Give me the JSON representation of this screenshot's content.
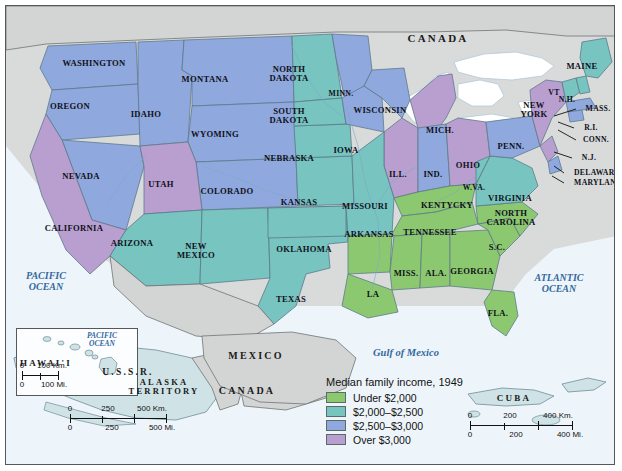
{
  "title": "Median family income, 1949",
  "legend": {
    "title": "Median family income, 1949",
    "items": [
      {
        "label": "Under $2,000",
        "color": "#8cc870"
      },
      {
        "label": "$2,000–$2,500",
        "color": "#77c4c0"
      },
      {
        "label": "$2,500–$3,000",
        "color": "#8fa8dd"
      },
      {
        "label": "Over $3,000",
        "color": "#b89fcf"
      }
    ]
  },
  "chart_data": {
    "type": "map",
    "title": "Median family income, 1949",
    "categories": [
      "Under $2,000",
      "$2,000–$2,500",
      "$2,500–$3,000",
      "Over $3,000"
    ],
    "colors": [
      "#8cc870",
      "#77c4c0",
      "#8fa8dd",
      "#b89fcf"
    ],
    "regions": [
      {
        "name": "WASHINGTON",
        "category": "$2,500–$3,000"
      },
      {
        "name": "OREGON",
        "category": "$2,500–$3,000"
      },
      {
        "name": "IDAHO",
        "category": "$2,500–$3,000"
      },
      {
        "name": "MONTANA",
        "category": "$2,500–$3,000"
      },
      {
        "name": "NEVADA",
        "category": "$2,500–$3,000"
      },
      {
        "name": "WYOMING",
        "category": "$2,500–$3,000"
      },
      {
        "name": "CALIFORNIA",
        "category": "Over $3,000"
      },
      {
        "name": "UTAH",
        "category": "Over $3,000"
      },
      {
        "name": "COLORADO",
        "category": "$2,500–$3,000"
      },
      {
        "name": "ARIZONA",
        "category": "$2,000–$2,500"
      },
      {
        "name": "NEW MEXICO",
        "category": "$2,000–$2,500"
      },
      {
        "name": "TEXAS",
        "category": "$2,000–$2,500"
      },
      {
        "name": "OKLAHOMA",
        "category": "$2,000–$2,500"
      },
      {
        "name": "KANSAS",
        "category": "$2,000–$2,500"
      },
      {
        "name": "NEBRASKA",
        "category": "$2,000–$2,500"
      },
      {
        "name": "NORTH DAKOTA",
        "category": "$2,000–$2,500"
      },
      {
        "name": "SOUTH DAKOTA",
        "category": "$2,000–$2,500"
      },
      {
        "name": "MINN.",
        "category": "$2,500–$3,000"
      },
      {
        "name": "IOWA",
        "category": "$2,500–$3,000"
      },
      {
        "name": "WISCONSIN",
        "category": "$2,500–$3,000"
      },
      {
        "name": "MICH.",
        "category": "Over $3,000"
      },
      {
        "name": "ILL.",
        "category": "Over $3,000"
      },
      {
        "name": "IND.",
        "category": "$2,500–$3,000"
      },
      {
        "name": "OHIO",
        "category": "Over $3,000"
      },
      {
        "name": "MISSOURI",
        "category": "$2,000–$2,500"
      },
      {
        "name": "ARKANSAS",
        "category": "Under $2,000"
      },
      {
        "name": "KENTYCKY",
        "category": "Under $2,000"
      },
      {
        "name": "TENNESSEE",
        "category": "Under $2,000"
      },
      {
        "name": "MISS.",
        "category": "Under $2,000"
      },
      {
        "name": "ALA.",
        "category": "Under $2,000"
      },
      {
        "name": "GEORGIA",
        "category": "Under $2,000"
      },
      {
        "name": "LA",
        "category": "Under $2,000"
      },
      {
        "name": "FLA.",
        "category": "Under $2,000"
      },
      {
        "name": "S.C.",
        "category": "Under $2,000"
      },
      {
        "name": "NORTH CAROLINA",
        "category": "Under $2,000"
      },
      {
        "name": "VIRGINIA",
        "category": "$2,000–$2,500"
      },
      {
        "name": "W.VA.",
        "category": "$2,000–$2,500"
      },
      {
        "name": "MARYLAND",
        "category": "$2,500–$3,000"
      },
      {
        "name": "DELAWARE",
        "category": "$2,500–$3,000"
      },
      {
        "name": "PENN.",
        "category": "$2,500–$3,000"
      },
      {
        "name": "NEW YORK",
        "category": "Over $3,000"
      },
      {
        "name": "N.J.",
        "category": "Over $3,000"
      },
      {
        "name": "CONN.",
        "category": "Over $3,000"
      },
      {
        "name": "R.I.",
        "category": "$2,500–$3,000"
      },
      {
        "name": "MASS.",
        "category": "$2,500–$3,000"
      },
      {
        "name": "VT",
        "category": "$2,000–$2,500"
      },
      {
        "name": "N.H.",
        "category": "$2,000–$2,500"
      },
      {
        "name": "MAINE",
        "category": "$2,000–$2,500"
      },
      {
        "name": "ALASKA TERRITORY",
        "category": "$2,000–$2,500"
      },
      {
        "name": "HAWAI'I",
        "category": "$2,000–$2,500"
      }
    ]
  },
  "states": [
    {
      "id": "washington",
      "label": "WASHINGTON",
      "x": 88,
      "y": 57,
      "size": "s9"
    },
    {
      "id": "oregon",
      "label": "OREGON",
      "x": 64,
      "y": 100,
      "size": "s9"
    },
    {
      "id": "idaho",
      "label": "IDAHO",
      "x": 140,
      "y": 108,
      "size": "s9"
    },
    {
      "id": "montana",
      "label": "MONTANA",
      "x": 199,
      "y": 73,
      "size": "s9"
    },
    {
      "id": "nevada",
      "label": "NEVADA",
      "x": 75,
      "y": 170,
      "size": "s9"
    },
    {
      "id": "wyoming",
      "label": "WYOMING",
      "x": 209,
      "y": 128,
      "size": "s9"
    },
    {
      "id": "california",
      "label": "CALIFORNIA",
      "x": 68,
      "y": 222,
      "size": "s9"
    },
    {
      "id": "utah",
      "label": "UTAH",
      "x": 155,
      "y": 178,
      "size": "s9"
    },
    {
      "id": "colorado",
      "label": "COLORADO",
      "x": 221,
      "y": 185,
      "size": "s9"
    },
    {
      "id": "arizona",
      "label": "ARIZONA",
      "x": 126,
      "y": 237,
      "size": "s9"
    },
    {
      "id": "new-mexico",
      "label": "NEW\nMEXICO",
      "x": 190,
      "y": 245,
      "size": "s9"
    },
    {
      "id": "texas",
      "label": "TEXAS",
      "x": 285,
      "y": 293,
      "size": "s9"
    },
    {
      "id": "oklahoma",
      "label": "OKLAHOMA",
      "x": 298,
      "y": 243,
      "size": "s9"
    },
    {
      "id": "kansas",
      "label": "KANSAS",
      "x": 293,
      "y": 196,
      "size": "s9"
    },
    {
      "id": "nebraska",
      "label": "NEBRASKA",
      "x": 283,
      "y": 152,
      "size": "s9"
    },
    {
      "id": "north-dakota",
      "label": "NORTH\nDAKOTA",
      "x": 283,
      "y": 68,
      "size": "s9"
    },
    {
      "id": "south-dakota",
      "label": "SOUTH\nDAKOTA",
      "x": 283,
      "y": 110,
      "size": "s9"
    },
    {
      "id": "minnesota",
      "label": "MINN.",
      "x": 335,
      "y": 88,
      "size": "s8"
    },
    {
      "id": "iowa",
      "label": "IOWA",
      "x": 340,
      "y": 144,
      "size": "s9"
    },
    {
      "id": "wisconsin",
      "label": "WISCONSIN",
      "x": 374,
      "y": 104,
      "size": "s9"
    },
    {
      "id": "michigan",
      "label": "MICH.",
      "x": 434,
      "y": 124,
      "size": "s9"
    },
    {
      "id": "illinois",
      "label": "ILL.",
      "x": 392,
      "y": 168,
      "size": "s9"
    },
    {
      "id": "indiana",
      "label": "IND.",
      "x": 427,
      "y": 168,
      "size": "s9"
    },
    {
      "id": "ohio",
      "label": "OHIO",
      "x": 462,
      "y": 159,
      "size": "s9"
    },
    {
      "id": "missouri",
      "label": "MISSOURI",
      "x": 359,
      "y": 200,
      "size": "s9"
    },
    {
      "id": "arkansas",
      "label": "ARKANSAS",
      "x": 363,
      "y": 228,
      "size": "s9"
    },
    {
      "id": "kentucky",
      "label": "KENTYCKY",
      "x": 441,
      "y": 199,
      "size": "s9"
    },
    {
      "id": "tennessee",
      "label": "TENNESSEE",
      "x": 424,
      "y": 226,
      "size": "s9"
    },
    {
      "id": "mississippi",
      "label": "MISS.",
      "x": 400,
      "y": 267,
      "size": "s9"
    },
    {
      "id": "alabama",
      "label": "ALA.",
      "x": 430,
      "y": 267,
      "size": "s9"
    },
    {
      "id": "georgia",
      "label": "GEORGIA",
      "x": 466,
      "y": 265,
      "size": "s9"
    },
    {
      "id": "louisiana",
      "label": "LA",
      "x": 367,
      "y": 288,
      "size": "s9"
    },
    {
      "id": "florida",
      "label": "FLA.",
      "x": 492,
      "y": 307,
      "size": "s9"
    },
    {
      "id": "south-carolina",
      "label": "S.C.",
      "x": 491,
      "y": 241,
      "size": "s9"
    },
    {
      "id": "north-carolina",
      "label": "NORTH\nCAROLINA",
      "x": 505,
      "y": 212,
      "size": "s9"
    },
    {
      "id": "virginia",
      "label": "VIRGINIA",
      "x": 504,
      "y": 192,
      "size": "s9"
    },
    {
      "id": "west-virginia",
      "label": "W.VA.",
      "x": 468,
      "y": 182,
      "size": "s8"
    },
    {
      "id": "pennsylvania",
      "label": "PENN.",
      "x": 505,
      "y": 140,
      "size": "s9"
    },
    {
      "id": "new-york",
      "label": "NEW\nYORK",
      "x": 528,
      "y": 104,
      "size": "s9"
    },
    {
      "id": "vermont",
      "label": "VT",
      "x": 548,
      "y": 87,
      "size": "s8"
    },
    {
      "id": "new-hampshire",
      "label": "N.H.",
      "x": 561,
      "y": 94,
      "size": "s8"
    },
    {
      "id": "maine",
      "label": "MAINE",
      "x": 576,
      "y": 60,
      "size": "s9"
    },
    {
      "id": "massachusetts",
      "label": "MASS.",
      "x": 592,
      "y": 103,
      "size": "s8"
    },
    {
      "id": "rhode-island",
      "label": "R.I.",
      "x": 585,
      "y": 122,
      "size": "s8"
    },
    {
      "id": "connecticut",
      "label": "CONN.",
      "x": 590,
      "y": 134,
      "size": "s8"
    },
    {
      "id": "new-jersey",
      "label": "N.J.",
      "x": 583,
      "y": 152,
      "size": "s8"
    },
    {
      "id": "delaware",
      "label": "DELAWARE",
      "x": 591,
      "y": 167,
      "size": "s8"
    },
    {
      "id": "maryland",
      "label": "MARYLAND",
      "x": 592,
      "y": 177,
      "size": "s8"
    }
  ],
  "oceans": [
    {
      "id": "pacific-ocean",
      "label": "PACIFIC\nOCEAN",
      "x": 40,
      "y": 275,
      "size": 10
    },
    {
      "id": "atlantic-ocean",
      "label": "ATLANTIC\nOCEAN",
      "x": 553,
      "y": 277,
      "size": 10
    },
    {
      "id": "gulf-of-mexico",
      "label": "Gulf of Mexico",
      "x": 400,
      "y": 347,
      "size": 10.5
    },
    {
      "id": "pacific-inset",
      "label": "PACIFIC\nOCEAN",
      "x": 96,
      "y": 334,
      "size": 7.5
    }
  ],
  "countries": [
    {
      "id": "canada-top",
      "label": "CANADA",
      "x": 432,
      "y": 33,
      "size": 11
    },
    {
      "id": "canada-inset",
      "label": "CANADA",
      "x": 241,
      "y": 385,
      "size": 10
    },
    {
      "id": "mexico",
      "label": "MEXICO",
      "x": 250,
      "y": 350,
      "size": 10
    },
    {
      "id": "ussr",
      "label": "U.S.S.R.",
      "x": 122,
      "y": 367,
      "size": 9.5
    },
    {
      "id": "cuba",
      "label": "CUBA",
      "x": 508,
      "y": 393,
      "size": 9
    },
    {
      "id": "alaska",
      "label": "ALASKA\nTERRITORY",
      "x": 158,
      "y": 381,
      "size": 8.5
    },
    {
      "id": "hawaii",
      "label": "HAWAI'I",
      "x": 40,
      "y": 358,
      "size": 9
    }
  ],
  "scales": {
    "hawaii": {
      "top_labels": [
        "0",
        "100 Km."
      ],
      "bottom_labels": [
        "0",
        "100 Mi."
      ]
    },
    "alaska": {
      "top_labels": [
        "0",
        "250",
        "500 Km."
      ],
      "bottom_labels": [
        "0",
        "250",
        "500 Mi."
      ]
    },
    "main": {
      "top_labels": [
        "0",
        "200",
        "400 Km."
      ],
      "bottom_labels": [
        "0",
        "200",
        "400 Mi."
      ]
    }
  }
}
